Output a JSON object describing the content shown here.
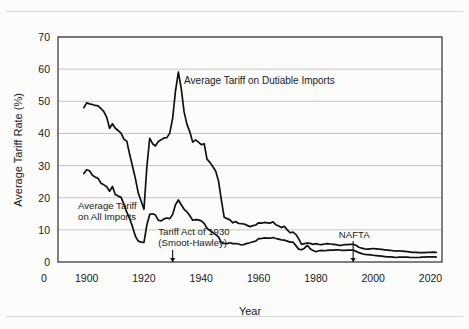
{
  "chart_data": {
    "type": "line",
    "title": "",
    "xlabel": "Year",
    "ylabel": "Average Tariff Rate (%)",
    "xlim": [
      1890,
      2024
    ],
    "ylim": [
      0,
      70
    ],
    "grid": true,
    "legend_position": "inline-annotations",
    "xticks": [
      "0",
      "1900",
      "1920",
      "1940",
      "1960",
      "1980",
      "2000",
      "2020"
    ],
    "xtick_values": [
      1890,
      1900,
      1920,
      1940,
      1960,
      1980,
      2000,
      2020
    ],
    "yticks": [
      "0",
      "10",
      "20",
      "30",
      "40",
      "50",
      "60",
      "70"
    ],
    "ytick_values": [
      0,
      10,
      20,
      30,
      40,
      50,
      60,
      70
    ],
    "series": [
      {
        "name": "Average Tariff on Dutiable Imports",
        "color": "#111111",
        "x": [
          1899,
          1900,
          1901,
          1902,
          1903,
          1904,
          1905,
          1906,
          1907,
          1908,
          1909,
          1910,
          1911,
          1912,
          1913,
          1914,
          1915,
          1916,
          1917,
          1918,
          1919,
          1920,
          1921,
          1922,
          1923,
          1924,
          1925,
          1926,
          1927,
          1928,
          1929,
          1930,
          1931,
          1932,
          1933,
          1934,
          1935,
          1936,
          1937,
          1938,
          1939,
          1940,
          1941,
          1942,
          1943,
          1944,
          1945,
          1946,
          1947,
          1948,
          1949,
          1950,
          1951,
          1952,
          1953,
          1954,
          1955,
          1956,
          1957,
          1958,
          1959,
          1960,
          1961,
          1962,
          1963,
          1964,
          1965,
          1966,
          1967,
          1968,
          1969,
          1970,
          1971,
          1972,
          1973,
          1974,
          1975,
          1976,
          1977,
          1978,
          1979,
          1980,
          1981,
          1982,
          1983,
          1984,
          1985,
          1986,
          1987,
          1988,
          1989,
          1990,
          1991,
          1992,
          1993,
          1994,
          1995,
          1996,
          1997,
          1998,
          1999,
          2000,
          2001,
          2002,
          2003,
          2004,
          2005,
          2006,
          2007,
          2008,
          2009,
          2010,
          2011,
          2012,
          2013,
          2014,
          2015,
          2016,
          2017,
          2018,
          2019,
          2020,
          2021,
          2022
        ],
        "values": [
          48.0,
          49.5,
          49.2,
          49.0,
          48.7,
          48.6,
          47.7,
          46.8,
          45.0,
          41.6,
          43.0,
          41.6,
          40.9,
          40.1,
          38.2,
          37.6,
          33.5,
          29.8,
          26.0,
          21.5,
          19.0,
          16.4,
          29.5,
          38.5,
          36.8,
          36.1,
          37.5,
          38.0,
          38.6,
          38.7,
          40.1,
          44.7,
          53.2,
          59.1,
          54.0,
          46.7,
          42.8,
          40.5,
          37.3,
          38.0,
          37.3,
          36.5,
          36.8,
          32.0,
          31.0,
          29.7,
          28.3,
          25.3,
          19.3,
          13.9,
          13.5,
          13.1,
          12.2,
          12.6,
          12.0,
          11.9,
          11.8,
          11.4,
          11.0,
          11.3,
          11.5,
          12.2,
          12.1,
          12.3,
          12.2,
          12.1,
          12.5,
          11.6,
          11.2,
          10.7,
          11.1,
          10.0,
          9.1,
          9.3,
          8.6,
          7.2,
          5.5,
          5.7,
          5.9,
          5.8,
          5.5,
          5.7,
          5.5,
          5.4,
          5.6,
          5.7,
          5.6,
          5.5,
          5.4,
          5.2,
          5.2,
          5.4,
          5.4,
          5.5,
          5.5,
          5.2,
          4.6,
          4.3,
          4.1,
          4.0,
          4.1,
          4.2,
          4.1,
          4.0,
          3.9,
          3.8,
          3.7,
          3.6,
          3.5,
          3.4,
          3.5,
          3.4,
          3.3,
          3.2,
          3.1,
          3.0,
          3.0,
          2.9,
          2.9,
          2.9,
          3.0,
          3.0,
          3.1,
          3.0
        ]
      },
      {
        "name": "Average Tariff on All Imports",
        "color": "#111111",
        "x": [
          1899,
          1900,
          1901,
          1902,
          1903,
          1904,
          1905,
          1906,
          1907,
          1908,
          1909,
          1910,
          1911,
          1912,
          1913,
          1914,
          1915,
          1916,
          1917,
          1918,
          1919,
          1920,
          1921,
          1922,
          1923,
          1924,
          1925,
          1926,
          1927,
          1928,
          1929,
          1930,
          1931,
          1932,
          1933,
          1934,
          1935,
          1936,
          1937,
          1938,
          1939,
          1940,
          1941,
          1942,
          1943,
          1944,
          1945,
          1946,
          1947,
          1948,
          1949,
          1950,
          1951,
          1952,
          1953,
          1954,
          1955,
          1956,
          1957,
          1958,
          1959,
          1960,
          1961,
          1962,
          1963,
          1964,
          1965,
          1966,
          1967,
          1968,
          1969,
          1970,
          1971,
          1972,
          1973,
          1974,
          1975,
          1976,
          1977,
          1978,
          1979,
          1980,
          1981,
          1982,
          1983,
          1984,
          1985,
          1986,
          1987,
          1988,
          1989,
          1990,
          1991,
          1992,
          1993,
          1994,
          1995,
          1996,
          1997,
          1998,
          1999,
          2000,
          2001,
          2002,
          2003,
          2004,
          2005,
          2006,
          2007,
          2008,
          2009,
          2010,
          2011,
          2012,
          2013,
          2014,
          2015,
          2016,
          2017,
          2018,
          2019,
          2020,
          2021,
          2022
        ],
        "values": [
          27.5,
          28.7,
          28.4,
          27.0,
          26.4,
          26.0,
          24.5,
          24.0,
          23.4,
          22.0,
          23.5,
          21.0,
          20.5,
          20.1,
          18.0,
          15.5,
          13.5,
          11.0,
          8.0,
          6.5,
          6.2,
          6.1,
          11.5,
          14.8,
          15.0,
          14.6,
          13.0,
          12.8,
          13.4,
          13.7,
          13.5,
          14.8,
          17.8,
          19.3,
          17.8,
          16.4,
          15.6,
          14.4,
          13.0,
          13.2,
          13.1,
          12.8,
          12.0,
          10.5,
          9.8,
          9.2,
          8.5,
          7.8,
          6.0,
          5.8,
          5.7,
          6.0,
          5.7,
          5.7,
          5.6,
          5.3,
          5.5,
          5.8,
          6.0,
          6.3,
          6.5,
          7.3,
          7.3,
          7.5,
          7.4,
          7.4,
          7.6,
          7.3,
          7.1,
          6.9,
          6.8,
          6.5,
          6.2,
          6.2,
          5.1,
          4.0,
          3.8,
          4.3,
          5.2,
          4.1,
          3.6,
          3.2,
          3.5,
          3.6,
          3.5,
          3.6,
          3.7,
          3.7,
          3.8,
          3.8,
          3.6,
          3.6,
          3.7,
          3.7,
          3.7,
          3.3,
          2.9,
          2.6,
          2.4,
          2.3,
          2.2,
          2.1,
          2.0,
          1.9,
          1.8,
          1.7,
          1.6,
          1.6,
          1.5,
          1.4,
          1.5,
          1.5,
          1.5,
          1.5,
          1.4,
          1.4,
          1.4,
          1.4,
          1.5,
          1.5,
          1.6,
          1.6,
          1.6,
          1.5
        ]
      }
    ],
    "annotations": [
      {
        "name": "dutiable-label",
        "text": "Average Tariff on Dutiable Imports",
        "x": 1934,
        "y": 55.5
      },
      {
        "name": "all-imports-label",
        "line1": "Average Tariff",
        "line2": "on All Imports",
        "x": 1897,
        "y": 16.5
      },
      {
        "name": "smoot-hawley-label",
        "line1": "Tariff Act of 1930",
        "line2": "(Smoot-Hawley)",
        "x": 1925,
        "y": 8.5,
        "marker_year": 1930
      },
      {
        "name": "nafta-label",
        "text": "NAFTA",
        "x": 1988,
        "y": 7.5,
        "marker_year": 1993
      }
    ]
  },
  "style": {
    "line_color": "#111111",
    "grid_color": "#b6b6b6",
    "frame_color": "#4a4a4a",
    "page_bg": "#fcfcfb"
  }
}
